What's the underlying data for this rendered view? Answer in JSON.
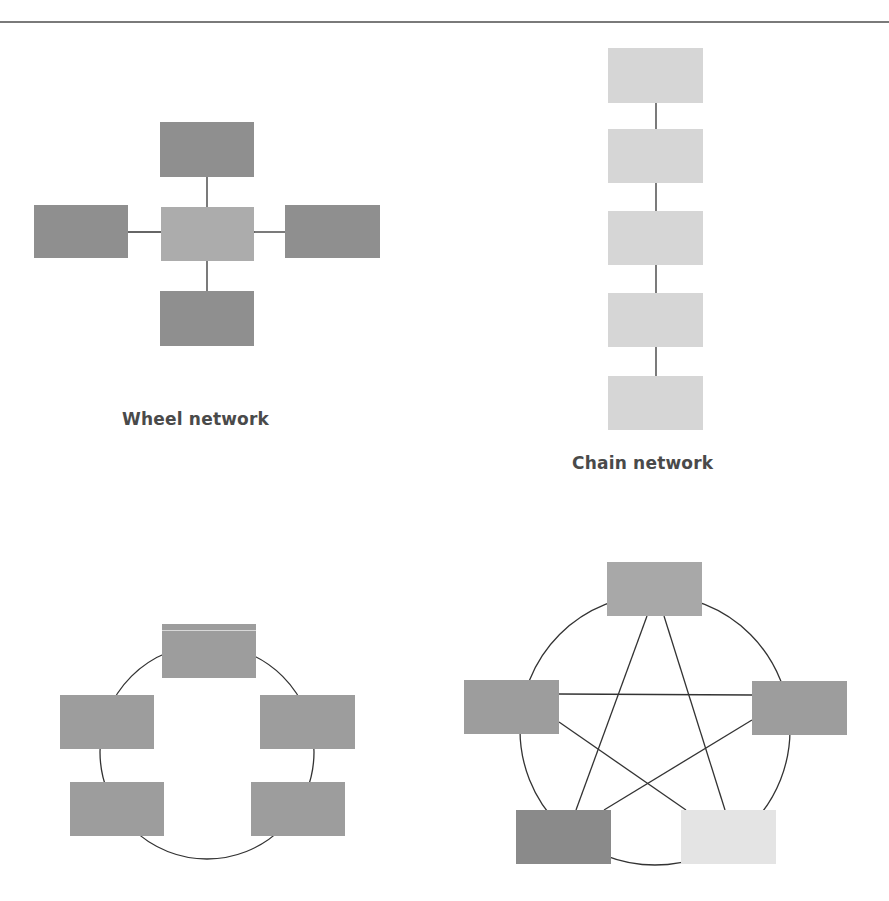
{
  "diagrams": {
    "wheel": {
      "label": "Wheel network",
      "node_count": 5,
      "hub": "center"
    },
    "chain": {
      "label": "Chain network",
      "node_count": 5
    },
    "circle": {
      "label": "",
      "node_count": 5
    },
    "all_channel": {
      "label": "",
      "node_count": 5
    }
  },
  "colors": {
    "rule": "#7a7a7a",
    "line": "#333333",
    "node_dark": "#8f8f8f",
    "node_mid": "#a8a8a8",
    "node_light": "#d6d6d6",
    "node_pale": "#e4e4e4",
    "label": "#4a4a4a"
  }
}
